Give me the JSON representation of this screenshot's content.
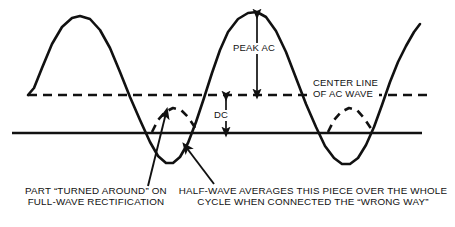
{
  "figure": {
    "type": "technical-waveform-diagram",
    "background_color": "#ffffff",
    "ink_color": "#111111"
  },
  "labels": {
    "peak_ac": "PEAK AC",
    "dc": "DC",
    "center_line_l1": "CENTER LINE",
    "center_line_l2": "OF AC WAVE"
  },
  "captions": {
    "left_l1": "PART “TURNED AROUND” ON",
    "left_l2": "FULL-WAVE RECTIFICATION",
    "right_l1": "HALF-WAVE AVERAGES THIS PIECE OVER THE WHOLE",
    "right_l2": "CYCLE WHEN CONNECTED THE “WRONG WAY”"
  },
  "chart_data": {
    "type": "line",
    "title": "",
    "xlabel": "",
    "ylabel": "",
    "grid": false,
    "legend": false,
    "axis_ranges": {
      "x": [
        0,
        455
      ],
      "y": [
        0,
        227
      ]
    },
    "reference_lines": [
      {
        "name": "center-line-of-ac-wave",
        "style": "dashed",
        "y": 95,
        "x_start": 28,
        "x_end": 430,
        "label": "CENTER LINE OF AC WAVE",
        "dash_pattern": "9,6"
      },
      {
        "name": "dc-average-baseline",
        "style": "solid",
        "y": 133,
        "x_start": 12,
        "x_end": 422,
        "label": "DC"
      }
    ],
    "series": [
      {
        "name": "ac-sine-wave",
        "style": "solid",
        "stroke_width": 2.6,
        "description": "Full AC sine wave, two cycles, starting and ending at the center line",
        "points": "28,95 34,88 42,68 52,44 62,27 72,18 80,16 90,19 100,30 110,48 120,72 130,97 140,120 150,142 158,156 166,163 173,163 180,157 188,143 196,122 204,98 212,73 220,50 228,32 238,19 248,13 257,12 266,17 276,31 286,52 296,78 306,104 316,127 325,146 334,158 342,164 350,164 358,158 366,145 374,127 382,105 390,82 398,62 406,46 414,32 420,24"
      },
      {
        "name": "rectified-arc-first",
        "style": "dashed",
        "stroke_width": 2.6,
        "description": "First trough mirrored above the DC baseline: part turned around on full-wave rectification",
        "dash_pattern": "8,6",
        "points": "152,132 158,120 165,112 173,108 181,110 188,117 194,126 198,133"
      },
      {
        "name": "rectified-arc-second",
        "style": "dashed",
        "stroke_width": 2.6,
        "description": "Second trough mirrored above the DC baseline",
        "dash_pattern": "8,6",
        "points": "328,132 334,120 341,112 349,108 357,110 364,118 370,127 374,133"
      }
    ],
    "annotations": [
      {
        "name": "peak-ac-measure",
        "text": "PEAK AC",
        "type": "double-arrow-vertical",
        "x": 257,
        "y_top": 14,
        "y_bottom": 94,
        "measures": "peak amplitude of AC above the center line"
      },
      {
        "name": "dc-measure",
        "text": "DC",
        "type": "double-arrow-vertical",
        "x": 226,
        "y_top": 96,
        "y_bottom": 132,
        "measures": "DC average level below the AC center line"
      },
      {
        "name": "center-line-pointer",
        "text": "CENTER LINE OF AC WAVE",
        "type": "text-label",
        "x": 312,
        "y": 78
      },
      {
        "name": "leader-left-to-rectified-arc",
        "type": "leader-arrow",
        "from": [
          148,
          186
        ],
        "to": [
          166,
          113
        ],
        "points_at": "rectified-arc-first",
        "caption": "PART “TURNED AROUND” ON FULL-WAVE RECTIFICATION"
      },
      {
        "name": "leader-right-to-trough",
        "type": "leader-arrow",
        "from": [
          214,
          184
        ],
        "to": [
          186,
          147
        ],
        "points_at": "negative-half-cycle",
        "caption": "HALF-WAVE AVERAGES THIS PIECE OVER THE WHOLE CYCLE WHEN CONNECTED THE “WRONG WAY”"
      }
    ]
  }
}
